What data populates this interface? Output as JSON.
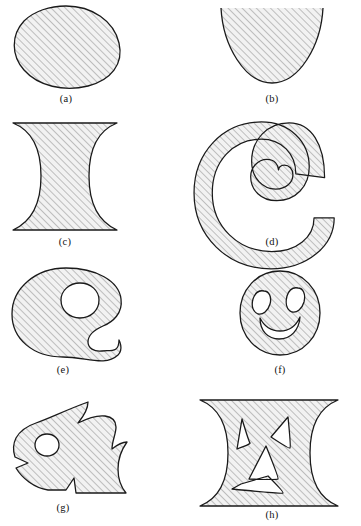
{
  "figure": {
    "background_color": "#ffffff",
    "outline_color": "#1a1a1a",
    "hatch_color": "#8d8d8d",
    "fill_color": "#f2f2f2",
    "hatch_angle_degrees": 45,
    "columns": 2,
    "rows": 4
  },
  "panels": [
    {
      "key": "a",
      "label": "(a)",
      "shape_name": "oval-blob-region",
      "description": "Closed convex blob, tilted oval",
      "holes": 0,
      "clipped": false
    },
    {
      "key": "b",
      "label": "(b)",
      "shape_name": "parabolic-region",
      "description": "Upward-opening parabolic region clipped at top edge",
      "holes": 0,
      "clipped": true
    },
    {
      "key": "c",
      "label": "(c)",
      "shape_name": "hourglass-region",
      "description": "Region between two hyperbolic branches, clipped top and bottom",
      "holes": 0,
      "clipped": true
    },
    {
      "key": "d",
      "label": "(d)",
      "shape_name": "spiral-region",
      "description": "Thick spiral band curling inward",
      "holes": 0,
      "clipped": false
    },
    {
      "key": "e",
      "label": "(e)",
      "shape_name": "palette-region",
      "description": "Blob with one circular hole and a C-shaped notch on the right",
      "holes": 1,
      "clipped": false
    },
    {
      "key": "f",
      "label": "(f)",
      "shape_name": "smiley-face-region",
      "description": "Disk with two oval eye holes and a crescent mouth hole",
      "holes": 3,
      "clipped": false
    },
    {
      "key": "g",
      "label": "(g)",
      "shape_name": "fish-head-region",
      "description": "Fish-head silhouette with circular eye hole, mouth notch and fin notch",
      "holes": 1,
      "clipped": false
    },
    {
      "key": "h",
      "label": "(h)",
      "shape_name": "hourglass-face-region",
      "description": "Hourglass region with triangular eye holes and a chevron mouth slit",
      "holes": 4,
      "clipped": true
    }
  ]
}
